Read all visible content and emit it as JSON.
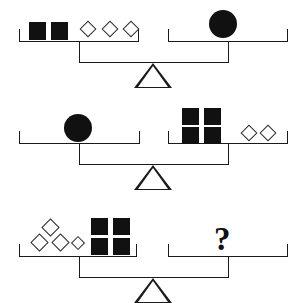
{
  "figure": {
    "type": "balance-scale-puzzle",
    "ink_color": "#111111",
    "background_color": "#ffffff",
    "unknown_symbol": "?"
  },
  "symbols": {
    "square": {
      "name": "filled-square",
      "fill": "#111111"
    },
    "diamond": {
      "name": "outlined-diamond",
      "fill": "none",
      "stroke": "#2a2a2a"
    },
    "circle": {
      "name": "filled-circle",
      "fill": "#111111"
    },
    "question": {
      "name": "question-mark",
      "glyph": "?"
    }
  },
  "balances": [
    {
      "id": "balance-1",
      "label": "Balance 1",
      "left": {
        "label": "left-pan",
        "contents": [
          {
            "shape": "square",
            "count": 2
          },
          {
            "shape": "diamond",
            "count": 3
          }
        ]
      },
      "right": {
        "label": "right-pan",
        "contents": [
          {
            "shape": "circle",
            "count": 1
          }
        ]
      },
      "relation": "equals"
    },
    {
      "id": "balance-2",
      "label": "Balance 2",
      "left": {
        "label": "left-pan",
        "contents": [
          {
            "shape": "circle",
            "count": 1
          }
        ]
      },
      "right": {
        "label": "right-pan",
        "contents": [
          {
            "shape": "square",
            "count": 4
          },
          {
            "shape": "diamond",
            "count": 2
          }
        ]
      },
      "relation": "equals"
    },
    {
      "id": "balance-3",
      "label": "Balance 3",
      "left": {
        "label": "left-pan",
        "contents": [
          {
            "shape": "diamond",
            "count": 4
          },
          {
            "shape": "square",
            "count": 4
          }
        ]
      },
      "right": {
        "label": "right-pan",
        "contents": [
          {
            "shape": "question",
            "count": 1,
            "glyph": "?"
          }
        ]
      },
      "relation": "unknown"
    }
  ]
}
